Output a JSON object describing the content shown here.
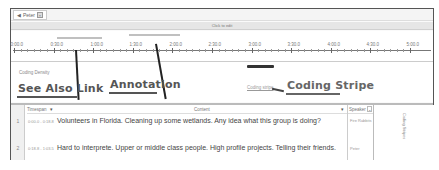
{
  "tab": {
    "label": "Peter",
    "icon": "audio-icon"
  },
  "clickbar": {
    "label": "Click to edit"
  },
  "timeline": {
    "ticks": [
      "0:00.0",
      "0:30.0",
      "1:00.0",
      "1:30.0",
      "2:00.0",
      "2:30.0",
      "3:00.0",
      "3:30.0",
      "4:00.0",
      "4:30.0",
      "5:00.0"
    ]
  },
  "coding_density": {
    "label": "Coding Density",
    "stripe_label": "Coding stripe"
  },
  "callouts": {
    "see_also": "See Also Link",
    "annotation": "Annotation",
    "coding_stripe": "Coding Stripe"
  },
  "grid": {
    "headers": {
      "timespan": "Timespan",
      "content": "Content",
      "speaker": "Speaker"
    },
    "rows": [
      {
        "num": "1",
        "timespan": "0:00.0 - 0:18.8",
        "content": "Volunteers in Florida. Cleaning up some wetlands. Any idea what this group is doing?",
        "speaker": "Fire Rabbits"
      },
      {
        "num": "2",
        "timespan": "0:18.8 - 1:03.5",
        "content": "Hard to interprete. Upper or middle class people. High profile projects. Telling their friends.",
        "speaker": "Peter"
      }
    ],
    "coding_panel_label": "Coding Stripes"
  }
}
